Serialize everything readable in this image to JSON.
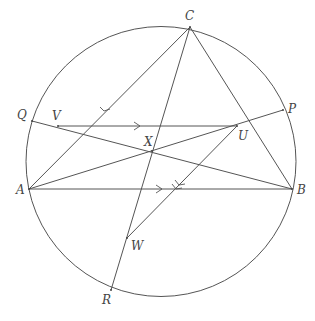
{
  "colors": {
    "stroke": "#555555",
    "label": "#444444",
    "background": "#ffffff"
  },
  "circle": {
    "cx": 161,
    "cy": 161.5,
    "r": 135
  },
  "points": {
    "C": {
      "x": 190,
      "y": 27,
      "label": "C",
      "lx": 185,
      "ly": 20
    },
    "A": {
      "x": 29,
      "y": 189,
      "label": "A",
      "lx": 16,
      "ly": 194
    },
    "B": {
      "x": 292,
      "y": 189,
      "label": "B",
      "lx": 297,
      "ly": 194
    },
    "Q": {
      "x": 32,
      "y": 121,
      "label": "Q",
      "lx": 17,
      "ly": 119
    },
    "P": {
      "x": 283,
      "y": 110,
      "label": "P",
      "lx": 288,
      "ly": 113
    },
    "R": {
      "x": 111,
      "y": 290,
      "label": "R",
      "lx": 102,
      "ly": 304
    },
    "V": {
      "x": 58,
      "y": 126,
      "label": "V",
      "lx": 52,
      "ly": 120
    },
    "U": {
      "x": 237,
      "y": 126,
      "label": "U",
      "lx": 238,
      "ly": 140
    },
    "X": {
      "x": 152,
      "y": 151,
      "label": "X",
      "lx": 144,
      "ly": 146
    },
    "W": {
      "x": 127,
      "y": 238,
      "label": "W",
      "lx": 131,
      "ly": 250
    }
  },
  "segments": [
    {
      "name": "segment-ca",
      "from": "C",
      "to": "A"
    },
    {
      "name": "segment-cb",
      "from": "C",
      "to": "B"
    },
    {
      "name": "segment-cr",
      "from": "C",
      "to": "R"
    },
    {
      "name": "segment-ab",
      "from": "A",
      "to": "B"
    },
    {
      "name": "segment-qb",
      "from": "Q",
      "to": "B"
    },
    {
      "name": "segment-ap",
      "from": "A",
      "to": "P"
    },
    {
      "name": "segment-vu",
      "from": "V",
      "to": "U"
    },
    {
      "name": "segment-uw",
      "from": "U",
      "to": "W"
    }
  ],
  "arrows": [
    {
      "name": "arrow-on-ca",
      "at": [
        104,
        111
      ],
      "dir": "down-left"
    },
    {
      "name": "arrow-on-vu",
      "at": [
        139,
        126
      ],
      "dir": "right"
    },
    {
      "name": "arrow-on-ab",
      "at": [
        162,
        189
      ],
      "dir": "right"
    },
    {
      "name": "arrow-on-uw",
      "at": [
        177,
        183
      ],
      "dir": "down-left"
    }
  ]
}
